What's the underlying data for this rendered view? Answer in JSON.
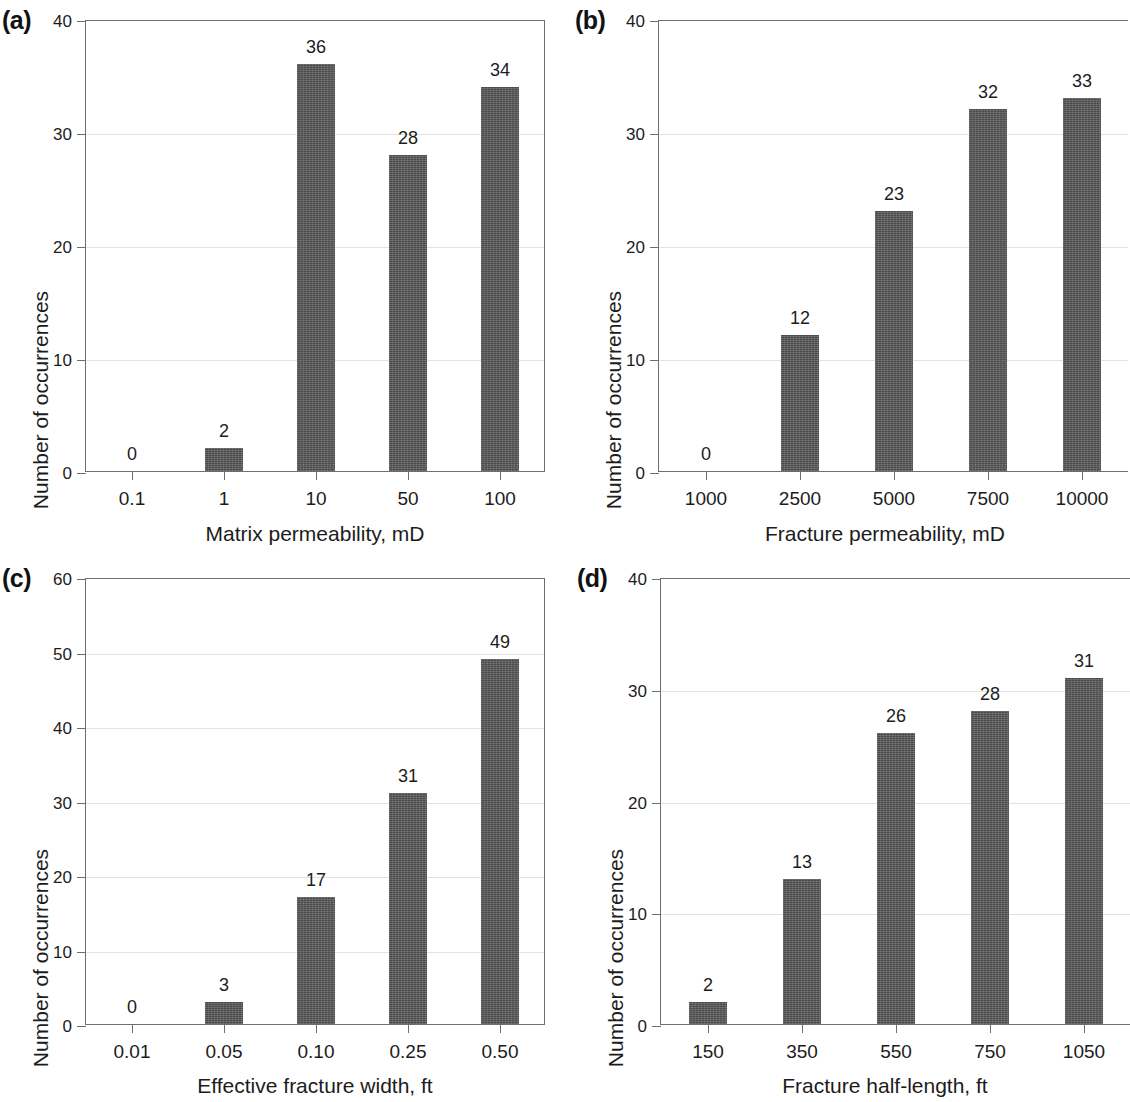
{
  "figure": {
    "panel_count": 4,
    "bar_color": "#5a5a5a",
    "axis_color": "#6e6e6e",
    "grid_color": "#e2e2e2",
    "background": "#ffffff"
  },
  "panels": [
    {
      "key": "a",
      "label": "(a)",
      "ylabel": "Number of occurrences",
      "xlabel": "Matrix permeability, mD",
      "yticks": [
        "0",
        "10",
        "20",
        "30",
        "40"
      ],
      "xticklabels": [
        "0.1",
        "1",
        "10",
        "50",
        "100"
      ],
      "barlabels": [
        "0",
        "2",
        "36",
        "28",
        "34"
      ]
    },
    {
      "key": "b",
      "label": "(b)",
      "ylabel": "Number of occurrences",
      "xlabel": "Fracture permeability, mD",
      "yticks": [
        "0",
        "10",
        "20",
        "30",
        "40"
      ],
      "xticklabels": [
        "1000",
        "2500",
        "5000",
        "7500",
        "10000"
      ],
      "barlabels": [
        "0",
        "12",
        "23",
        "32",
        "33"
      ]
    },
    {
      "key": "c",
      "label": "(c)",
      "ylabel": "Number of occurrences",
      "xlabel": "Effective fracture width, ft",
      "yticks": [
        "0",
        "10",
        "20",
        "30",
        "40",
        "50",
        "60"
      ],
      "xticklabels": [
        "0.01",
        "0.05",
        "0.10",
        "0.25",
        "0.50"
      ],
      "barlabels": [
        "0",
        "3",
        "17",
        "31",
        "49"
      ]
    },
    {
      "key": "d",
      "label": "(d)",
      "ylabel": "Number of occurrences",
      "xlabel": "Fracture half-length, ft",
      "yticks": [
        "0",
        "10",
        "20",
        "30",
        "40"
      ],
      "xticklabels": [
        "150",
        "350",
        "550",
        "750",
        "1050"
      ],
      "barlabels": [
        "2",
        "13",
        "26",
        "28",
        "31"
      ]
    }
  ],
  "chart_data": [
    {
      "type": "bar",
      "panel": "(a)",
      "title": "",
      "xlabel": "Matrix permeability, mD",
      "ylabel": "Number of occurrences",
      "categories": [
        "0.1",
        "1",
        "10",
        "50",
        "100"
      ],
      "values": [
        0,
        2,
        36,
        28,
        34
      ],
      "data_labels": [
        "0",
        "2",
        "36",
        "28",
        "34"
      ],
      "ylim": [
        0,
        40
      ],
      "yticks": [
        0,
        10,
        20,
        30,
        40
      ],
      "grid": true,
      "legend": null
    },
    {
      "type": "bar",
      "panel": "(b)",
      "title": "",
      "xlabel": "Fracture permeability, mD",
      "ylabel": "Number of occurrences",
      "categories": [
        "1000",
        "2500",
        "5000",
        "7500",
        "10000"
      ],
      "values": [
        0,
        12,
        23,
        32,
        33
      ],
      "data_labels": [
        "0",
        "12",
        "23",
        "32",
        "33"
      ],
      "ylim": [
        0,
        40
      ],
      "yticks": [
        0,
        10,
        20,
        30,
        40
      ],
      "grid": true,
      "legend": null
    },
    {
      "type": "bar",
      "panel": "(c)",
      "title": "",
      "xlabel": "Effective fracture width, ft",
      "ylabel": "Number of occurrences",
      "categories": [
        "0.01",
        "0.05",
        "0.10",
        "0.25",
        "0.50"
      ],
      "values": [
        0,
        3,
        17,
        31,
        49
      ],
      "data_labels": [
        "0",
        "3",
        "17",
        "31",
        "49"
      ],
      "ylim": [
        0,
        60
      ],
      "yticks": [
        0,
        10,
        20,
        30,
        40,
        50,
        60
      ],
      "grid": true,
      "legend": null
    },
    {
      "type": "bar",
      "panel": "(d)",
      "title": "",
      "xlabel": "Fracture half-length, ft",
      "ylabel": "Number of occurrences",
      "categories": [
        "150",
        "350",
        "550",
        "750",
        "1050"
      ],
      "values": [
        2,
        13,
        26,
        28,
        31
      ],
      "data_labels": [
        "2",
        "13",
        "26",
        "28",
        "31"
      ],
      "ylim": [
        0,
        40
      ],
      "yticks": [
        0,
        10,
        20,
        30,
        40
      ],
      "grid": true,
      "legend": null
    }
  ]
}
